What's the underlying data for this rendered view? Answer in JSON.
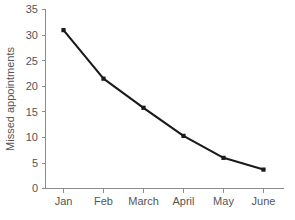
{
  "chart_data": {
    "type": "line",
    "title": "",
    "subtitle": "",
    "xlabel": "",
    "ylabel": "Missed appointments",
    "categories": [
      "Jan",
      "Feb",
      "March",
      "April",
      "May",
      "June"
    ],
    "values": [
      31,
      21.5,
      15.8,
      10.3,
      6,
      3.7
    ],
    "series": [
      {
        "name": "Missed appointments",
        "values": [
          31,
          21.5,
          15.8,
          10.3,
          6,
          3.7
        ]
      }
    ],
    "ylim": [
      0,
      35
    ],
    "yticks": [
      "0",
      "5",
      "10",
      "15",
      "20",
      "25",
      "30",
      "35"
    ],
    "ytick_values": [
      0,
      5,
      10,
      15,
      20,
      25,
      30,
      35
    ],
    "xticks": [
      "Jan",
      "Feb",
      "March",
      "April",
      "May",
      "June"
    ],
    "grid": false,
    "legend": false,
    "legend_position": "none",
    "marker": "square",
    "colors": {
      "line": "#1a1a1a",
      "marker": "#1a1a1a",
      "axis": "#8c8c8c",
      "text": "#555555",
      "background": "#ffffff"
    }
  }
}
